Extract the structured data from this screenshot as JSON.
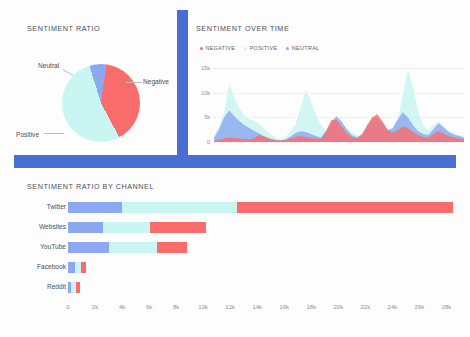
{
  "theme": {
    "accent": "#4a6fd4",
    "negative": "#fa6b6b",
    "positive": "#c9f5f2",
    "neutral": "#8ba8f0",
    "background": "#fdfdfd",
    "text": "#4a4f59",
    "axis_text": "#8d919a"
  },
  "panels": {
    "sentiment_ratio": {
      "title": "SENTIMENT RATIO",
      "labels": {
        "neutral": "Neutral",
        "negative": "Negative",
        "positive": "Positive"
      }
    },
    "sentiment_over_time": {
      "title": "SENTIMENT OVER TIME",
      "legend": [
        {
          "label": "NEGATIVE",
          "color": "#fa6b6b"
        },
        {
          "label": "POSITIVE",
          "color": "#c9f5f2"
        },
        {
          "label": "NEUTRAL",
          "color": "#8ba8f0"
        }
      ]
    },
    "sentiment_by_channel": {
      "title": "SENTIMENT RATIO BY CHANNEL"
    }
  },
  "chart_data": [
    {
      "type": "pie",
      "title": "SENTIMENT RATIO",
      "labels": [
        "Negative",
        "Positive",
        "Neutral"
      ],
      "values": [
        40,
        53,
        7
      ],
      "colors": [
        "#fa6b6b",
        "#c9f5f2",
        "#8ba8f0"
      ],
      "legend": "annotated-callouts"
    },
    {
      "type": "area",
      "title": "SENTIMENT OVER TIME",
      "xlabel": "",
      "ylabel": "",
      "ylim": [
        0,
        17000
      ],
      "yticks": [
        0,
        5000,
        10000,
        15000
      ],
      "ytick_labels": [
        "0",
        "5k",
        "10k",
        "15k"
      ],
      "grid": true,
      "legend_position": "top-left",
      "stacked": false,
      "series": [
        {
          "name": "POSITIVE",
          "color": "#c9f5f2",
          "values": [
            1200,
            3200,
            6000,
            11800,
            9000,
            6800,
            5200,
            4600,
            4200,
            3600,
            2600,
            1600,
            900,
            600,
            1000,
            2200,
            3600,
            7000,
            10600,
            8200,
            5400,
            3400,
            2200,
            1800,
            2400,
            3600,
            2800,
            1900,
            1400,
            1100,
            1500,
            2400,
            3200,
            2600,
            1800,
            2400,
            4200,
            9600,
            14600,
            11200,
            6200,
            3400,
            2400,
            3400,
            4200,
            3200,
            2200,
            1700,
            1400,
            1200
          ]
        },
        {
          "name": "NEUTRAL",
          "color": "#8ba8f0",
          "values": [
            800,
            2600,
            5000,
            6400,
            5200,
            4200,
            3400,
            2800,
            2200,
            1600,
            1100,
            700,
            400,
            300,
            500,
            1100,
            1800,
            2200,
            2000,
            1600,
            1200,
            900,
            2400,
            4000,
            5200,
            4200,
            2600,
            1400,
            900,
            1600,
            3200,
            4600,
            5000,
            3800,
            2400,
            2800,
            4600,
            6000,
            5000,
            3400,
            2200,
            1600,
            1400,
            2600,
            3800,
            3000,
            2000,
            1500,
            1200,
            900
          ]
        },
        {
          "name": "NEGATIVE",
          "color": "#fa6b6b",
          "values": [
            200,
            400,
            700,
            900,
            800,
            700,
            600,
            500,
            900,
            1400,
            1000,
            600,
            400,
            300,
            400,
            700,
            1000,
            1200,
            1000,
            800,
            700,
            600,
            2200,
            4400,
            4600,
            3200,
            1800,
            1000,
            700,
            1400,
            3400,
            5000,
            5600,
            4200,
            2600,
            1800,
            2400,
            3200,
            2800,
            2000,
            1400,
            1000,
            900,
            1600,
            2200,
            1700,
            1200,
            900,
            700,
            600
          ]
        }
      ]
    },
    {
      "type": "bar",
      "orientation": "horizontal",
      "stacked": true,
      "title": "SENTIMENT RATIO BY CHANNEL",
      "categories": [
        "Twitter",
        "Websites",
        "YouTube",
        "Facebook",
        "Reddit"
      ],
      "xlim": [
        0,
        29000
      ],
      "xticks": [
        0,
        2000,
        4000,
        6000,
        8000,
        10000,
        12000,
        14000,
        16000,
        18000,
        20000,
        22000,
        24000,
        26000,
        28000
      ],
      "xtick_labels": [
        "0",
        "2k",
        "4k",
        "6k",
        "8k",
        "10k",
        "12k",
        "14k",
        "16k",
        "18k",
        "20k",
        "22k",
        "24k",
        "26k",
        "28k"
      ],
      "series": [
        {
          "name": "NEUTRAL",
          "color": "#8ba8f0",
          "values": [
            4000,
            2600,
            3000,
            500,
            250
          ]
        },
        {
          "name": "POSITIVE",
          "color": "#c9f5f2",
          "values": [
            8500,
            3500,
            3600,
            450,
            350
          ]
        },
        {
          "name": "NEGATIVE",
          "color": "#fa6b6b",
          "values": [
            16000,
            4100,
            2200,
            350,
            300
          ]
        }
      ],
      "totals": [
        28500,
        10200,
        8800,
        1300,
        900
      ]
    }
  ]
}
